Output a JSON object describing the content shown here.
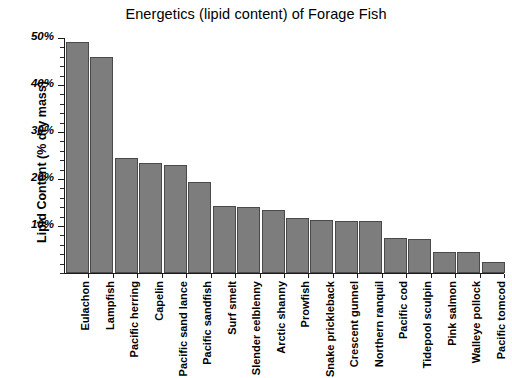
{
  "chart_data": {
    "type": "bar",
    "title": "Energetics (lipid content) of Forage Fish",
    "xlabel": "",
    "ylabel": "Lipid Content (% dry mass)",
    "ylim": [
      0,
      50
    ],
    "y_major_ticks": [
      50,
      40,
      30,
      20,
      10
    ],
    "y_tick_labels": [
      "50%",
      "40%",
      "30%",
      "20%",
      "10%"
    ],
    "y_minor_tick_step": 2,
    "grid": false,
    "legend": "none",
    "bar_color": "#7d7d7d",
    "bar_edge_color": "#4a4a4a",
    "categories": [
      "Eulachon",
      "Lampfish",
      "Pacific herring",
      "Capelin",
      "Pacific sand lance",
      "Pacific sandfish",
      "Surf smelt",
      "Slender eelblenny",
      "Arctic shanny",
      "Prowfish",
      "Snake prickleback",
      "Crescent gunnel",
      "Northern ranquil",
      "Pacific cod",
      "Tidepool sculpin",
      "Pink salmon",
      "Walleye pollock",
      "Pacific tomcod"
    ],
    "values": [
      49.1,
      45.9,
      24.5,
      23.4,
      23.0,
      19.4,
      14.3,
      14.1,
      13.4,
      11.6,
      11.2,
      11.0,
      11.0,
      7.4,
      7.2,
      4.5,
      4.4,
      2.3
    ]
  }
}
